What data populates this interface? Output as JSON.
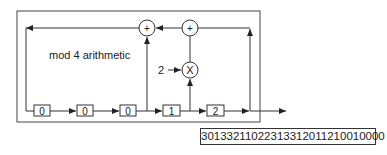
{
  "diagram": {
    "caption": "mod 4 arithmetic",
    "multiplier_constant": "2",
    "adder_symbol": "+",
    "multiplier_symbol": "X",
    "registers": [
      {
        "id": "r1",
        "value": "0"
      },
      {
        "id": "r2",
        "value": "0"
      },
      {
        "id": "r3",
        "value": "0"
      },
      {
        "id": "r4",
        "value": "1"
      },
      {
        "id": "r5",
        "value": "2"
      }
    ],
    "output_sequence": "30133211022313312011210010000"
  },
  "colors": {
    "line": "#333333",
    "background": "#ffffff"
  }
}
